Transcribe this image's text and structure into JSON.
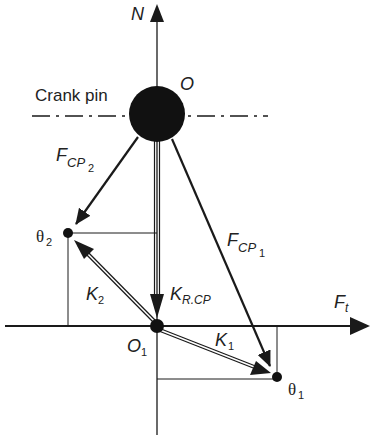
{
  "diagram": {
    "labels": {
      "n_axis": "N",
      "crank_pin": "Crank pin",
      "origin_o": "O",
      "origin_o1_main": "O",
      "origin_o1_sub": "1",
      "ft_main": "F",
      "ft_sub": "t",
      "fcp2_main": "F",
      "fcp2_sub": "CP",
      "fcp2_subsub": "2",
      "fcp1_main": "F",
      "fcp1_sub": "CP",
      "fcp1_subsub": "1",
      "k2_main": "K",
      "k2_sub": "2",
      "k1_main": "K",
      "k1_sub": "1",
      "krcp_main": "K",
      "krcp_sub": "R.CP",
      "theta2_main": "θ",
      "theta2_sub": "2",
      "theta1_main": "θ",
      "theta1_sub": "1"
    },
    "colors": {
      "ink": "#1a1a1a",
      "background": "#ffffff"
    }
  }
}
